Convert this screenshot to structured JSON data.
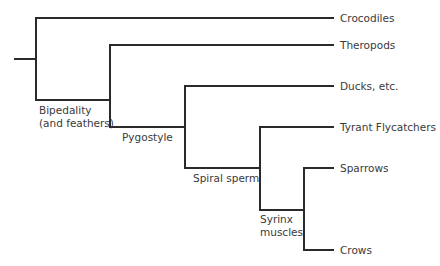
{
  "diagram": {
    "type": "cladogram",
    "line_color": "#2a2a2a",
    "text_color": "#3a3a3a",
    "taxa": [
      {
        "label": "Crocodiles"
      },
      {
        "label": "Theropods"
      },
      {
        "label": "Ducks, etc."
      },
      {
        "label": "Tyrant Flycatchers"
      },
      {
        "label": "Sparrows"
      },
      {
        "label": "Crows"
      }
    ],
    "traits": [
      {
        "line1": "Bipedality",
        "line2": "(and feathers)"
      },
      {
        "line1": "Pygostyle"
      },
      {
        "line1": "Spiral sperm"
      },
      {
        "line1": "Syrinx",
        "line2": "muscles"
      }
    ]
  }
}
